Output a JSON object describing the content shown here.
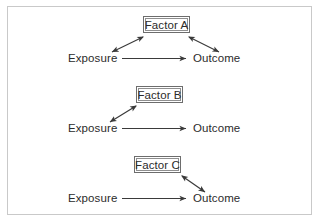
{
  "figure": {
    "frame_color": "#c9c9c9",
    "background": "#ffffff",
    "text_color": "#2b2b2b",
    "arrow_color": "#3a3a3a",
    "box_border_color": "#6d6d6d"
  },
  "diagrams": [
    {
      "id": "diagram-a",
      "factor_label": "Factor A",
      "exposure_label": "Exposure",
      "outcome_label": "Outcome",
      "main_arrow": "Exposure -> Outcome",
      "factor_links": [
        "Factor A <-> Exposure",
        "Factor A <-> Outcome"
      ]
    },
    {
      "id": "diagram-b",
      "factor_label": "Factor B",
      "exposure_label": "Exposure",
      "outcome_label": "Outcome",
      "main_arrow": "Exposure -> Outcome",
      "factor_links": [
        "Factor B <-> Exposure"
      ]
    },
    {
      "id": "diagram-c",
      "factor_label": "Factor C",
      "exposure_label": "Exposure",
      "outcome_label": "Outcome",
      "main_arrow": "Exposure -> Outcome",
      "factor_links": [
        "Factor C <-> Outcome"
      ]
    }
  ]
}
